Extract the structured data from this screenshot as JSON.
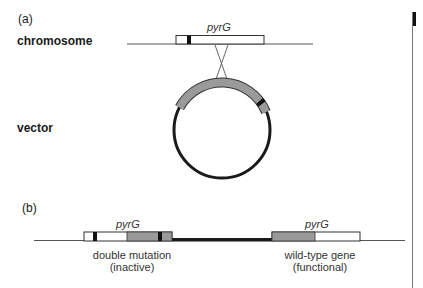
{
  "panel_a": {
    "label": "(a)",
    "chromosome_label": "chromosome",
    "vector_label": "vector",
    "gene_label": "pyrG"
  },
  "panel_b": {
    "label": "(b)",
    "left_gene_label": "pyrG",
    "right_gene_label": "pyrG",
    "left_caption_line1": "double mutation",
    "left_caption_line2": "(inactive)",
    "right_caption_line1": "wild-type gene",
    "right_caption_line2": "(functional)"
  },
  "colors": {
    "line": "#555555",
    "vector_backbone": "#1a1a1a",
    "gene_white": "#ffffff",
    "gene_gray": "#9a9a9a",
    "mutation_black": "#111111"
  }
}
